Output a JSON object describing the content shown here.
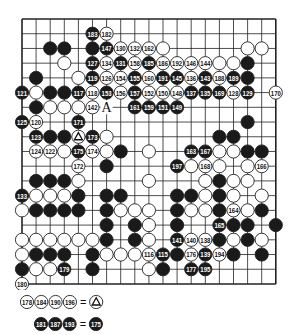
{
  "diagram": {
    "type": "go-board-record",
    "board_size": 19,
    "grid": {
      "x0": 22,
      "y0": 19,
      "dx": 14.1,
      "dy": 14.72
    },
    "colors": {
      "line": "#222222",
      "black": "#1a1a1a",
      "white": "#ffffff",
      "stone_border": "#222222",
      "black_text": "#ffffff",
      "white_text": "#111111"
    },
    "marks": [
      {
        "row": 6,
        "col": 6,
        "label": "A"
      }
    ],
    "stones": [
      {
        "row": 1,
        "col": 5,
        "color": "B",
        "n": "183"
      },
      {
        "row": 1,
        "col": 6,
        "color": "W",
        "n": "182"
      },
      {
        "row": 2,
        "col": 2,
        "color": "B",
        "n": ""
      },
      {
        "row": 2,
        "col": 3,
        "color": "B",
        "n": ""
      },
      {
        "row": 2,
        "col": 5,
        "color": "B",
        "n": ""
      },
      {
        "row": 2,
        "col": 6,
        "color": "B",
        "n": "147"
      },
      {
        "row": 2,
        "col": 7,
        "color": "W",
        "n": "130"
      },
      {
        "row": 2,
        "col": 8,
        "color": "W",
        "n": "132"
      },
      {
        "row": 2,
        "col": 9,
        "color": "W",
        "n": "162"
      },
      {
        "row": 2,
        "col": 10,
        "color": "W",
        "n": ""
      },
      {
        "row": 2,
        "col": 16,
        "color": "W",
        "n": ""
      },
      {
        "row": 2,
        "col": 17,
        "color": "W",
        "n": ""
      },
      {
        "row": 3,
        "col": 3,
        "color": "W",
        "n": ""
      },
      {
        "row": 3,
        "col": 5,
        "color": "B",
        "n": "127"
      },
      {
        "row": 3,
        "col": 6,
        "color": "W",
        "n": "134"
      },
      {
        "row": 3,
        "col": 7,
        "color": "B",
        "n": "131"
      },
      {
        "row": 3,
        "col": 8,
        "color": "W",
        "n": "158"
      },
      {
        "row": 3,
        "col": 9,
        "color": "B",
        "n": "185"
      },
      {
        "row": 3,
        "col": 10,
        "color": "W",
        "n": "186"
      },
      {
        "row": 3,
        "col": 11,
        "color": "W",
        "n": "192"
      },
      {
        "row": 3,
        "col": 12,
        "color": "W",
        "n": "146"
      },
      {
        "row": 3,
        "col": 13,
        "color": "W",
        "n": "144"
      },
      {
        "row": 3,
        "col": 14,
        "color": "W",
        "n": ""
      },
      {
        "row": 3,
        "col": 15,
        "color": "W",
        "n": ""
      },
      {
        "row": 3,
        "col": 16,
        "color": "B",
        "n": ""
      },
      {
        "row": 4,
        "col": 1,
        "color": "B",
        "n": ""
      },
      {
        "row": 4,
        "col": 4,
        "color": "W",
        "n": ""
      },
      {
        "row": 4,
        "col": 5,
        "color": "B",
        "n": "119"
      },
      {
        "row": 4,
        "col": 6,
        "color": "W",
        "n": "126"
      },
      {
        "row": 4,
        "col": 7,
        "color": "W",
        "n": "154"
      },
      {
        "row": 4,
        "col": 8,
        "color": "B",
        "n": "155"
      },
      {
        "row": 4,
        "col": 9,
        "color": "W",
        "n": "160"
      },
      {
        "row": 4,
        "col": 10,
        "color": "B",
        "n": "191"
      },
      {
        "row": 4,
        "col": 11,
        "color": "B",
        "n": "145"
      },
      {
        "row": 4,
        "col": 12,
        "color": "W",
        "n": "136"
      },
      {
        "row": 4,
        "col": 13,
        "color": "B",
        "n": "143"
      },
      {
        "row": 4,
        "col": 14,
        "color": "W",
        "n": "188"
      },
      {
        "row": 4,
        "col": 15,
        "color": "B",
        "n": "189"
      },
      {
        "row": 4,
        "col": 16,
        "color": "B",
        "n": ""
      },
      {
        "row": 5,
        "col": 0,
        "color": "B",
        "n": "121"
      },
      {
        "row": 5,
        "col": 1,
        "color": "W",
        "n": ""
      },
      {
        "row": 5,
        "col": 2,
        "color": "B",
        "n": ""
      },
      {
        "row": 5,
        "col": 3,
        "color": "B",
        "n": ""
      },
      {
        "row": 5,
        "col": 4,
        "color": "B",
        "n": "117"
      },
      {
        "row": 5,
        "col": 5,
        "color": "W",
        "n": "118"
      },
      {
        "row": 5,
        "col": 6,
        "color": "B",
        "n": "153"
      },
      {
        "row": 5,
        "col": 7,
        "color": "W",
        "n": "156"
      },
      {
        "row": 5,
        "col": 8,
        "color": "B",
        "n": "157"
      },
      {
        "row": 5,
        "col": 9,
        "color": "W",
        "n": "152"
      },
      {
        "row": 5,
        "col": 10,
        "color": "W",
        "n": "150"
      },
      {
        "row": 5,
        "col": 11,
        "color": "W",
        "n": "148"
      },
      {
        "row": 5,
        "col": 12,
        "color": "B",
        "n": "137"
      },
      {
        "row": 5,
        "col": 13,
        "color": "B",
        "n": "135"
      },
      {
        "row": 5,
        "col": 14,
        "color": "B",
        "n": "169"
      },
      {
        "row": 5,
        "col": 15,
        "color": "W",
        "n": "128"
      },
      {
        "row": 5,
        "col": 16,
        "color": "B",
        "n": "129"
      },
      {
        "row": 5,
        "col": 18,
        "color": "W",
        "n": "170"
      },
      {
        "row": 6,
        "col": 1,
        "color": "B",
        "n": ""
      },
      {
        "row": 6,
        "col": 2,
        "color": "W",
        "n": ""
      },
      {
        "row": 6,
        "col": 3,
        "color": "W",
        "n": ""
      },
      {
        "row": 6,
        "col": 4,
        "color": "W",
        "n": ""
      },
      {
        "row": 6,
        "col": 5,
        "color": "W",
        "n": "142"
      },
      {
        "row": 6,
        "col": 8,
        "color": "B",
        "n": "161"
      },
      {
        "row": 6,
        "col": 9,
        "color": "B",
        "n": "159"
      },
      {
        "row": 6,
        "col": 10,
        "color": "B",
        "n": "151"
      },
      {
        "row": 6,
        "col": 11,
        "color": "B",
        "n": "149"
      },
      {
        "row": 7,
        "col": 0,
        "color": "B",
        "n": "125"
      },
      {
        "row": 7,
        "col": 1,
        "color": "W",
        "n": "120"
      },
      {
        "row": 7,
        "col": 4,
        "color": "B",
        "n": "171"
      },
      {
        "row": 7,
        "col": 16,
        "color": "B",
        "n": ""
      },
      {
        "row": 8,
        "col": 1,
        "color": "B",
        "n": "123"
      },
      {
        "row": 8,
        "col": 2,
        "color": "B",
        "n": ""
      },
      {
        "row": 8,
        "col": 3,
        "color": "B",
        "n": ""
      },
      {
        "row": 8,
        "col": 4,
        "color": "W",
        "n": "",
        "mark": "triangle"
      },
      {
        "row": 8,
        "col": 5,
        "color": "B",
        "n": "173"
      },
      {
        "row": 8,
        "col": 6,
        "color": "W",
        "n": ""
      },
      {
        "row": 8,
        "col": 14,
        "color": "B",
        "n": ""
      },
      {
        "row": 8,
        "col": 15,
        "color": "B",
        "n": ""
      },
      {
        "row": 9,
        "col": 1,
        "color": "W",
        "n": "124"
      },
      {
        "row": 9,
        "col": 2,
        "color": "W",
        "n": "122"
      },
      {
        "row": 9,
        "col": 3,
        "color": "W",
        "n": ""
      },
      {
        "row": 9,
        "col": 4,
        "color": "B",
        "n": "175"
      },
      {
        "row": 9,
        "col": 5,
        "color": "W",
        "n": "174"
      },
      {
        "row": 9,
        "col": 6,
        "color": "W",
        "n": ""
      },
      {
        "row": 9,
        "col": 7,
        "color": "B",
        "n": ""
      },
      {
        "row": 9,
        "col": 9,
        "color": "W",
        "n": ""
      },
      {
        "row": 9,
        "col": 12,
        "color": "B",
        "n": "163"
      },
      {
        "row": 9,
        "col": 13,
        "color": "B",
        "n": "167"
      },
      {
        "row": 9,
        "col": 14,
        "color": "W",
        "n": ""
      },
      {
        "row": 9,
        "col": 15,
        "color": "W",
        "n": ""
      },
      {
        "row": 9,
        "col": 16,
        "color": "B",
        "n": ""
      },
      {
        "row": 9,
        "col": 17,
        "color": "B",
        "n": ""
      },
      {
        "row": 10,
        "col": 4,
        "color": "W",
        "n": "172"
      },
      {
        "row": 10,
        "col": 6,
        "color": "B",
        "n": ""
      },
      {
        "row": 10,
        "col": 11,
        "color": "B",
        "n": "197"
      },
      {
        "row": 10,
        "col": 12,
        "color": "W",
        "n": ""
      },
      {
        "row": 10,
        "col": 13,
        "color": "W",
        "n": "168"
      },
      {
        "row": 10,
        "col": 14,
        "color": "W",
        "n": ""
      },
      {
        "row": 10,
        "col": 16,
        "color": "W",
        "n": ""
      },
      {
        "row": 10,
        "col": 17,
        "color": "W",
        "n": "166"
      },
      {
        "row": 11,
        "col": 1,
        "color": "B",
        "n": ""
      },
      {
        "row": 11,
        "col": 2,
        "color": "B",
        "n": ""
      },
      {
        "row": 11,
        "col": 3,
        "color": "B",
        "n": ""
      },
      {
        "row": 11,
        "col": 4,
        "color": "W",
        "n": ""
      },
      {
        "row": 11,
        "col": 9,
        "color": "W",
        "n": ""
      },
      {
        "row": 11,
        "col": 13,
        "color": "W",
        "n": ""
      },
      {
        "row": 11,
        "col": 14,
        "color": "B",
        "n": ""
      },
      {
        "row": 11,
        "col": 15,
        "color": "W",
        "n": ""
      },
      {
        "row": 11,
        "col": 16,
        "color": "W",
        "n": ""
      },
      {
        "row": 12,
        "col": 0,
        "color": "B",
        "n": "133"
      },
      {
        "row": 12,
        "col": 1,
        "color": "W",
        "n": ""
      },
      {
        "row": 12,
        "col": 2,
        "color": "W",
        "n": ""
      },
      {
        "row": 12,
        "col": 3,
        "color": "W",
        "n": ""
      },
      {
        "row": 12,
        "col": 4,
        "color": "B",
        "n": ""
      },
      {
        "row": 12,
        "col": 6,
        "color": "B",
        "n": ""
      },
      {
        "row": 12,
        "col": 7,
        "color": "B",
        "n": ""
      },
      {
        "row": 12,
        "col": 11,
        "color": "B",
        "n": ""
      },
      {
        "row": 12,
        "col": 12,
        "color": "B",
        "n": ""
      },
      {
        "row": 12,
        "col": 13,
        "color": "W",
        "n": ""
      },
      {
        "row": 12,
        "col": 14,
        "color": "B",
        "n": ""
      },
      {
        "row": 12,
        "col": 15,
        "color": "W",
        "n": ""
      },
      {
        "row": 12,
        "col": 17,
        "color": "W",
        "n": ""
      },
      {
        "row": 13,
        "col": 0,
        "color": "W",
        "n": ""
      },
      {
        "row": 13,
        "col": 1,
        "color": "B",
        "n": ""
      },
      {
        "row": 13,
        "col": 2,
        "color": "B",
        "n": ""
      },
      {
        "row": 13,
        "col": 3,
        "color": "B",
        "n": ""
      },
      {
        "row": 13,
        "col": 4,
        "color": "B",
        "n": ""
      },
      {
        "row": 13,
        "col": 6,
        "color": "B",
        "n": ""
      },
      {
        "row": 13,
        "col": 7,
        "color": "W",
        "n": ""
      },
      {
        "row": 13,
        "col": 8,
        "color": "W",
        "n": ""
      },
      {
        "row": 13,
        "col": 9,
        "color": "W",
        "n": ""
      },
      {
        "row": 13,
        "col": 11,
        "color": "B",
        "n": ""
      },
      {
        "row": 13,
        "col": 12,
        "color": "W",
        "n": ""
      },
      {
        "row": 13,
        "col": 13,
        "color": "W",
        "n": ""
      },
      {
        "row": 13,
        "col": 14,
        "color": "B",
        "n": ""
      },
      {
        "row": 13,
        "col": 15,
        "color": "W",
        "n": "164"
      },
      {
        "row": 13,
        "col": 16,
        "color": "W",
        "n": ""
      },
      {
        "row": 13,
        "col": 17,
        "color": "B",
        "n": ""
      },
      {
        "row": 14,
        "col": 6,
        "color": "B",
        "n": ""
      },
      {
        "row": 14,
        "col": 8,
        "color": "B",
        "n": ""
      },
      {
        "row": 14,
        "col": 9,
        "color": "W",
        "n": ""
      },
      {
        "row": 14,
        "col": 11,
        "color": "B",
        "n": ""
      },
      {
        "row": 14,
        "col": 14,
        "color": "B",
        "n": "165"
      },
      {
        "row": 14,
        "col": 15,
        "color": "B",
        "n": ""
      },
      {
        "row": 14,
        "col": 16,
        "color": "B",
        "n": ""
      },
      {
        "row": 14,
        "col": 18,
        "color": "B",
        "n": ""
      },
      {
        "row": 15,
        "col": 0,
        "color": "W",
        "n": ""
      },
      {
        "row": 15,
        "col": 1,
        "color": "W",
        "n": ""
      },
      {
        "row": 15,
        "col": 2,
        "color": "W",
        "n": ""
      },
      {
        "row": 15,
        "col": 3,
        "color": "W",
        "n": ""
      },
      {
        "row": 15,
        "col": 4,
        "color": "W",
        "n": ""
      },
      {
        "row": 15,
        "col": 5,
        "color": "W",
        "n": ""
      },
      {
        "row": 15,
        "col": 6,
        "color": "B",
        "n": ""
      },
      {
        "row": 15,
        "col": 8,
        "color": "B",
        "n": ""
      },
      {
        "row": 15,
        "col": 9,
        "color": "W",
        "n": ""
      },
      {
        "row": 15,
        "col": 11,
        "color": "B",
        "n": "141"
      },
      {
        "row": 15,
        "col": 12,
        "color": "W",
        "n": "140"
      },
      {
        "row": 15,
        "col": 13,
        "color": "W",
        "n": "138"
      },
      {
        "row": 15,
        "col": 14,
        "color": "B",
        "n": ""
      },
      {
        "row": 15,
        "col": 15,
        "color": "W",
        "n": ""
      },
      {
        "row": 15,
        "col": 16,
        "color": "B",
        "n": ""
      },
      {
        "row": 15,
        "col": 17,
        "color": "W",
        "n": ""
      },
      {
        "row": 16,
        "col": 0,
        "color": "W",
        "n": ""
      },
      {
        "row": 16,
        "col": 1,
        "color": "B",
        "n": ""
      },
      {
        "row": 16,
        "col": 2,
        "color": "B",
        "n": ""
      },
      {
        "row": 16,
        "col": 3,
        "color": "B",
        "n": ""
      },
      {
        "row": 16,
        "col": 5,
        "color": "B",
        "n": ""
      },
      {
        "row": 16,
        "col": 6,
        "color": "W",
        "n": ""
      },
      {
        "row": 16,
        "col": 7,
        "color": "W",
        "n": ""
      },
      {
        "row": 16,
        "col": 8,
        "color": "W",
        "n": ""
      },
      {
        "row": 16,
        "col": 9,
        "color": "W",
        "n": "116"
      },
      {
        "row": 16,
        "col": 10,
        "color": "B",
        "n": "115"
      },
      {
        "row": 16,
        "col": 11,
        "color": "B",
        "n": ""
      },
      {
        "row": 16,
        "col": 12,
        "color": "W",
        "n": "176"
      },
      {
        "row": 16,
        "col": 13,
        "color": "B",
        "n": "139"
      },
      {
        "row": 16,
        "col": 14,
        "color": "W",
        "n": "194"
      },
      {
        "row": 16,
        "col": 15,
        "color": "B",
        "n": ""
      },
      {
        "row": 16,
        "col": 17,
        "color": "B",
        "n": ""
      },
      {
        "row": 17,
        "col": 0,
        "color": "B",
        "n": ""
      },
      {
        "row": 17,
        "col": 1,
        "color": "W",
        "n": ""
      },
      {
        "row": 17,
        "col": 2,
        "color": "W",
        "n": ""
      },
      {
        "row": 17,
        "col": 3,
        "color": "B",
        "n": "179"
      },
      {
        "row": 17,
        "col": 5,
        "color": "B",
        "n": ""
      },
      {
        "row": 17,
        "col": 9,
        "color": "W",
        "n": ""
      },
      {
        "row": 17,
        "col": 10,
        "color": "B",
        "n": ""
      },
      {
        "row": 17,
        "col": 12,
        "color": "B",
        "n": "177"
      },
      {
        "row": 17,
        "col": 13,
        "color": "B",
        "n": "195"
      },
      {
        "row": 18,
        "col": 0,
        "color": "W",
        "n": "180"
      }
    ]
  },
  "legend": {
    "line1": {
      "moves": [
        "178",
        "184",
        "190",
        "196"
      ],
      "color": "W",
      "equals": "=",
      "target_mark": "triangle"
    },
    "line2": {
      "moves": [
        "181",
        "187",
        "193"
      ],
      "color": "B",
      "equals": "=",
      "target": "175",
      "target_color": "B"
    }
  }
}
